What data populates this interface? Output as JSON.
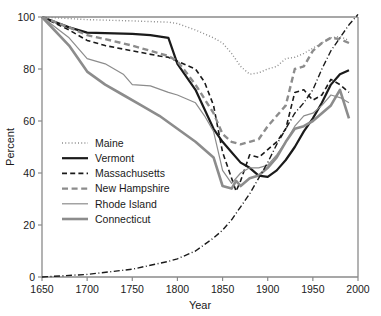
{
  "chart_data": {
    "type": "line",
    "title": "",
    "xlabel": "Year",
    "ylabel": "Percent",
    "xlim": [
      1650,
      2000
    ],
    "ylim": [
      0,
      100
    ],
    "xticks": [
      1650,
      1700,
      1750,
      1800,
      1850,
      1900,
      1950,
      2000
    ],
    "yticks": [
      0,
      20,
      40,
      60,
      80,
      100
    ],
    "grid": false,
    "legend_position": "center-left",
    "series": [
      {
        "name": "Maine",
        "style": "dotted",
        "color": "#8c8c8c",
        "width": 1.4,
        "x": [
          1650,
          1700,
          1750,
          1790,
          1800,
          1820,
          1840,
          1850,
          1860,
          1870,
          1880,
          1890,
          1900,
          1910,
          1920,
          1930,
          1940,
          1950,
          1960,
          1970,
          1980,
          1990
        ],
        "y": [
          100,
          99,
          98.5,
          98,
          97.5,
          95,
          92,
          90,
          86,
          81,
          78,
          78.5,
          80,
          81,
          84,
          84.5,
          86,
          88,
          90,
          92,
          92.5,
          91
        ]
      },
      {
        "name": "Vermont",
        "style": "solid",
        "color": "#1a1a1a",
        "width": 2.2,
        "x": [
          1650,
          1680,
          1700,
          1750,
          1770,
          1790,
          1800,
          1820,
          1840,
          1850,
          1860,
          1870,
          1880,
          1890,
          1900,
          1910,
          1920,
          1930,
          1940,
          1950,
          1960,
          1970,
          1980,
          1990
        ],
        "y": [
          100,
          96,
          94,
          93.5,
          93,
          92,
          82,
          72,
          57,
          52,
          48,
          44,
          42,
          39,
          38.5,
          41,
          45,
          50,
          56,
          61,
          67,
          74,
          78,
          79.5
        ]
      },
      {
        "name": "Massachusetts",
        "style": "dashed",
        "color": "#1a1a1a",
        "width": 1.6,
        "x": [
          1650,
          1680,
          1700,
          1720,
          1750,
          1780,
          1790,
          1800,
          1820,
          1830,
          1840,
          1850,
          1860,
          1865,
          1870,
          1880,
          1890,
          1900,
          1910,
          1920,
          1930,
          1940,
          1950,
          1960,
          1970,
          1980,
          1990
        ],
        "y": [
          100,
          95,
          91,
          89,
          87,
          85,
          84.5,
          83,
          80,
          75,
          66,
          48,
          38,
          33,
          37,
          47,
          46,
          49,
          52,
          57,
          71,
          72,
          68,
          70,
          76,
          74,
          71
        ]
      },
      {
        "name": "New Hampshire",
        "style": "dashed-heavy",
        "color": "#8c8c8c",
        "width": 2.4,
        "x": [
          1650,
          1680,
          1700,
          1720,
          1750,
          1780,
          1790,
          1800,
          1820,
          1840,
          1850,
          1860,
          1870,
          1880,
          1890,
          1900,
          1910,
          1920,
          1930,
          1940,
          1950,
          1960,
          1970,
          1980,
          1990
        ],
        "y": [
          100,
          96,
          93,
          91.5,
          89,
          86,
          85,
          83,
          74,
          63,
          55,
          52,
          51,
          52,
          53,
          58,
          62,
          66,
          80,
          81,
          87,
          90,
          92,
          91.5,
          90
        ]
      },
      {
        "name": "Rhode Island",
        "style": "solid",
        "color": "#8c8c8c",
        "width": 1.2,
        "x": [
          1650,
          1680,
          1700,
          1720,
          1740,
          1750,
          1770,
          1790,
          1800,
          1820,
          1830,
          1840,
          1850,
          1860,
          1870,
          1880,
          1890,
          1900,
          1910,
          1920,
          1930,
          1940,
          1950,
          1960,
          1970,
          1980,
          1990
        ],
        "y": [
          100,
          92,
          84,
          82,
          78,
          74,
          73.5,
          71,
          70,
          67,
          62,
          56,
          41,
          36,
          40,
          42,
          42,
          43,
          47,
          52,
          58,
          62,
          63,
          66,
          70,
          69,
          67
        ]
      },
      {
        "name": "Connecticut",
        "style": "solid",
        "color": "#8c8c8c",
        "width": 2.6,
        "x": [
          1650,
          1680,
          1700,
          1720,
          1740,
          1760,
          1780,
          1800,
          1820,
          1840,
          1850,
          1860,
          1865,
          1870,
          1880,
          1890,
          1900,
          1910,
          1920,
          1930,
          1940,
          1950,
          1960,
          1970,
          1980,
          1990
        ],
        "y": [
          100,
          89,
          79,
          74,
          70,
          66,
          62,
          57,
          52,
          46,
          35,
          34,
          37,
          35,
          38,
          39,
          42,
          46,
          52,
          57,
          58,
          60,
          63,
          66,
          72,
          61
        ]
      },
      {
        "name": "population",
        "style": "dash-dot",
        "color": "#1a1a1a",
        "width": 1.4,
        "x": [
          1650,
          1700,
          1750,
          1790,
          1800,
          1820,
          1840,
          1850,
          1860,
          1870,
          1880,
          1890,
          1900,
          1910,
          1920,
          1930,
          1940,
          1950,
          1960,
          1970,
          1980,
          1990,
          2000
        ],
        "y": [
          0,
          1,
          3,
          6,
          7,
          10,
          15,
          18,
          22,
          27,
          32,
          38,
          44,
          51,
          57,
          63,
          67,
          72,
          80,
          87,
          92,
          97,
          101
        ]
      }
    ],
    "legend_entries": [
      {
        "label": "Maine",
        "style": "dotted",
        "color": "#8c8c8c",
        "width": 1.4
      },
      {
        "label": "Vermont",
        "style": "solid",
        "color": "#1a1a1a",
        "width": 2.2
      },
      {
        "label": "Massachusetts",
        "style": "dashed",
        "color": "#1a1a1a",
        "width": 1.6
      },
      {
        "label": "New Hampshire",
        "style": "dashed-heavy",
        "color": "#8c8c8c",
        "width": 2.4
      },
      {
        "label": "Rhode Island",
        "style": "solid",
        "color": "#8c8c8c",
        "width": 1.2
      },
      {
        "label": "Connecticut",
        "style": "solid",
        "color": "#8c8c8c",
        "width": 2.6
      }
    ]
  }
}
